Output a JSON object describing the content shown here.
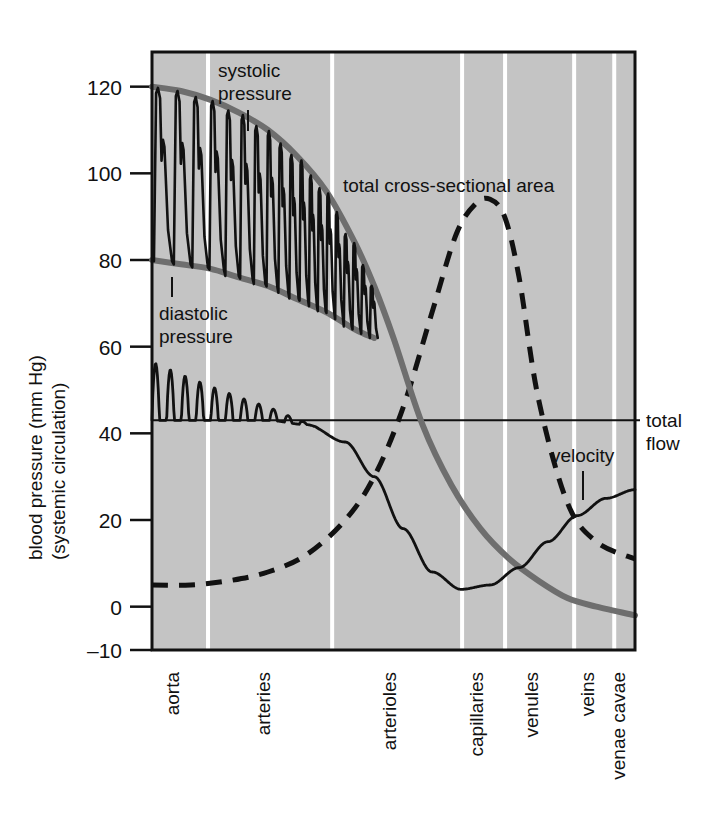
{
  "figure": {
    "y_axis_title_line1": "blood pressure (mm Hg)",
    "y_axis_title_line2": "(systemic circulation)"
  },
  "annotations": {
    "systolic_line1": "systolic",
    "systolic_line2": "pressure",
    "diastolic_line1": "diastolic",
    "diastolic_line2": "pressure",
    "area_label": "total cross-sectional area",
    "velocity_label": "velocity",
    "total_flow_line1": "total",
    "total_flow_line2": "flow"
  },
  "colors": {
    "plot_background": "#c4c4c4",
    "divider": "#ffffff",
    "pressure_curve": "#6e6e6e",
    "ink": "#111111",
    "frame": "#111111"
  },
  "chart_data": {
    "type": "line",
    "title": "",
    "xlabel": "",
    "ylabel": "blood pressure (mm Hg) (systemic circulation)",
    "ylim": [
      -10,
      128
    ],
    "yticks": [
      -10,
      0,
      20,
      40,
      60,
      80,
      100,
      120
    ],
    "ytick_labels": [
      "–10",
      "0",
      "20",
      "40",
      "60",
      "80",
      "100",
      "120"
    ],
    "grid": false,
    "legend": "none",
    "categories": [
      "aorta",
      "arteries",
      "arterioles",
      "capillaries",
      "venules",
      "veins",
      "venae cavae"
    ],
    "category_boundaries_fraction": [
      0.0,
      0.116,
      0.373,
      0.642,
      0.731,
      0.874,
      0.957,
      1.0
    ],
    "total_flow_level": 43,
    "series": [
      {
        "name": "systolic pressure",
        "style": "solid-thick-gray",
        "x": [
          0.0,
          0.06,
          0.12,
          0.18,
          0.24,
          0.3,
          0.36,
          0.42,
          0.46,
          0.5,
          0.56,
          0.62,
          0.68,
          0.74,
          0.8,
          0.86,
          0.92,
          1.0
        ],
        "values": [
          120,
          119,
          117,
          114,
          110,
          104,
          96,
          84,
          74,
          62,
          42,
          28,
          18,
          11,
          6,
          2,
          0,
          -2
        ]
      },
      {
        "name": "diastolic pressure",
        "style": "solid-thick-gray",
        "x": [
          0.0,
          0.06,
          0.12,
          0.18,
          0.24,
          0.3,
          0.36,
          0.42,
          0.46
        ],
        "values": [
          80,
          79,
          78,
          76,
          74,
          71,
          68,
          64,
          62
        ]
      },
      {
        "name": "total cross-sectional area",
        "style": "dashed-black",
        "x": [
          0.0,
          0.08,
          0.16,
          0.24,
          0.32,
          0.4,
          0.46,
          0.52,
          0.58,
          0.63,
          0.67,
          0.7,
          0.73,
          0.76,
          0.8,
          0.86,
          0.92,
          1.0
        ],
        "values": [
          5,
          5,
          6,
          8,
          12,
          20,
          30,
          46,
          68,
          86,
          93,
          94,
          90,
          76,
          48,
          24,
          15,
          11
        ]
      },
      {
        "name": "velocity",
        "style": "solid-black-pulsatile",
        "x": [
          0.0,
          0.08,
          0.16,
          0.24,
          0.32,
          0.4,
          0.46,
          0.52,
          0.58,
          0.64,
          0.7,
          0.76,
          0.82,
          0.88,
          0.94,
          1.0
        ],
        "values": [
          43,
          43,
          43,
          43,
          42,
          38,
          30,
          18,
          8,
          4,
          5,
          9,
          15,
          21,
          25,
          27
        ],
        "note": "pulsatile oscillations above baseline damping from aorta through arteries"
      }
    ]
  }
}
